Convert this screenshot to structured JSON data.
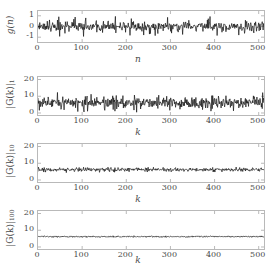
{
  "figure": {
    "background": "#ffffff",
    "trace_color": "#141414",
    "axis_color": "#b9b9b9",
    "text_color": "#4a4a4a"
  },
  "chart_data": [
    {
      "type": "line",
      "id": "panel-1",
      "title": "",
      "xlabel": "n",
      "ylabel": "g(n)",
      "ylabel_base": "g(n)",
      "ylabel_sub": "",
      "xlim": [
        0,
        512
      ],
      "ylim": [
        -1.45,
        1.45
      ],
      "xticks": [
        0,
        100,
        200,
        300,
        400,
        500
      ],
      "xticklabels": [
        "0",
        "100",
        "200",
        "300",
        "400",
        "500"
      ],
      "yticks": [
        -1,
        0,
        1
      ],
      "yticklabels": [
        "-1",
        "0",
        "1"
      ],
      "grid": false,
      "n_points": 512,
      "mean": 0,
      "noise_amp": 0.42,
      "spike_amp": 0.95,
      "seed": 17,
      "description": "zero-mean white gaussian noise signal g(n), amplitude roughly +/-0.6 with occasional excursions to +/-1"
    },
    {
      "type": "line",
      "id": "panel-2",
      "title": "",
      "xlabel": "k",
      "ylabel": "|G(k)|_1",
      "ylabel_base": "|G(k)|",
      "ylabel_sub": "1",
      "xlim": [
        0,
        512
      ],
      "ylim": [
        -1.2,
        21.5
      ],
      "xticks": [
        0,
        100,
        200,
        300,
        400,
        500
      ],
      "xticklabels": [
        "0",
        "100",
        "200",
        "300",
        "400",
        "500"
      ],
      "yticks": [
        0,
        10,
        20
      ],
      "yticklabels": [
        "0",
        "10",
        "20"
      ],
      "grid": false,
      "n_points": 512,
      "mean": 6.2,
      "noise_amp": 3.3,
      "spike_amp": 6.6,
      "seed": 53,
      "description": "magnitude spectrum |G(k)| from a single realization, fluctuating about 6 with range roughly 0.5 to 14"
    },
    {
      "type": "line",
      "id": "panel-3",
      "title": "",
      "xlabel": "k",
      "ylabel": "|G(k)|_10",
      "ylabel_base": "|G(k)|",
      "ylabel_sub": "10",
      "xlim": [
        0,
        512
      ],
      "ylim": [
        -1.2,
        21.5
      ],
      "xticks": [
        0,
        100,
        200,
        300,
        400,
        500
      ],
      "xticklabels": [
        "0",
        "100",
        "200",
        "300",
        "400",
        "500"
      ],
      "yticks": [
        0,
        10,
        20
      ],
      "yticklabels": [
        "0",
        "10",
        "20"
      ],
      "grid": false,
      "n_points": 512,
      "mean": 6.2,
      "noise_amp": 1.05,
      "spike_amp": 1.6,
      "seed": 91,
      "description": "magnitude spectrum averaged over 10 realizations, tight band about 6 with +/-1 fluctuation"
    },
    {
      "type": "line",
      "id": "panel-4",
      "title": "",
      "xlabel": "k",
      "ylabel": "|G(k)|_100",
      "ylabel_base": "|G(k)|",
      "ylabel_sub": "100",
      "xlim": [
        0,
        512
      ],
      "ylim": [
        -1.2,
        21.5
      ],
      "xticks": [
        0,
        100,
        200,
        300,
        400,
        500
      ],
      "xticklabels": [
        "0",
        "100",
        "200",
        "300",
        "400",
        "500"
      ],
      "yticks": [
        0,
        10,
        20
      ],
      "yticklabels": [
        "0",
        "10",
        "20"
      ],
      "grid": false,
      "n_points": 512,
      "mean": 6.2,
      "noise_amp": 0.34,
      "spike_amp": 0.5,
      "seed": 128,
      "description": "magnitude spectrum averaged over 100 realizations, nearly flat line at 6"
    }
  ]
}
